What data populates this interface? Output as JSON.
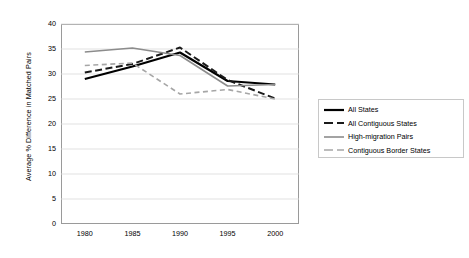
{
  "chart_data": {
    "type": "line",
    "title": "",
    "xlabel": "",
    "ylabel": "Average % Difference in Matched Pairs",
    "x": [
      1980,
      1985,
      1990,
      1995,
      2000
    ],
    "xtick_labels": [
      "1980",
      "1985",
      "1990",
      "1995",
      "2000"
    ],
    "xlim": [
      1977.5,
      2002.5
    ],
    "ylim": [
      0,
      40
    ],
    "ytick_labels": [
      "0",
      "5",
      "10",
      "15",
      "20",
      "25",
      "30",
      "35",
      "40"
    ],
    "yticks": [
      0,
      5,
      10,
      15,
      20,
      25,
      30,
      35,
      40
    ],
    "grid": "horizontal",
    "legend_position": "right",
    "series": [
      {
        "name": "All States",
        "values": [
          29.0,
          31.5,
          34.3,
          28.6,
          27.9
        ],
        "color": "#000000",
        "style": "solid",
        "width": 2.2
      },
      {
        "name": "All Contiguous States",
        "values": [
          30.3,
          32.0,
          35.3,
          28.8,
          25.1
        ],
        "color": "#1a1a1a",
        "style": "dashed",
        "width": 2.0
      },
      {
        "name": "High-migration Pairs",
        "values": [
          34.4,
          35.2,
          33.7,
          27.6,
          27.9
        ],
        "color": "#8c8c8c",
        "style": "solid",
        "width": 1.6
      },
      {
        "name": "Contiguous Border States",
        "values": [
          31.7,
          32.2,
          26.0,
          26.9,
          25.0
        ],
        "color": "#a6a6a6",
        "style": "dashed",
        "width": 1.6
      }
    ]
  },
  "legend": {
    "items": [
      {
        "label": "All States"
      },
      {
        "label": "All Contiguous States"
      },
      {
        "label": "High-migration Pairs"
      },
      {
        "label": "Contiguous Border States"
      }
    ]
  },
  "axes": {
    "y_title": "Average % Difference in Matched Pairs",
    "frame_color": "#9a9a9a",
    "gridline_color": "#d9d9d9"
  }
}
